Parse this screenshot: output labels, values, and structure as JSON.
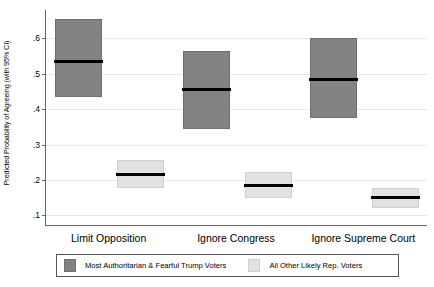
{
  "chart_data": {
    "type": "bar",
    "title": "",
    "xlabel": "",
    "ylabel": "Predicted Probability of Agreeing (with 95% CI)",
    "ylim": [
      0.07,
      0.68
    ],
    "yticks": [
      0.1,
      0.2,
      0.3,
      0.4,
      0.5,
      0.6
    ],
    "ytick_labels": [
      ".1",
      ".2",
      ".3",
      ".4",
      ".5",
      ".6"
    ],
    "grid": true,
    "legend_position": "bottom",
    "categories": [
      "Limit Opposition",
      "Ignore Congress",
      "Ignore Supreme Court"
    ],
    "series": [
      {
        "name": "Most Authoritarian & Fearful Trump Voters",
        "color": "#838383",
        "values": [
          0.535,
          0.455,
          0.485
        ],
        "ci_low": [
          0.433,
          0.345,
          0.375
        ],
        "ci_high": [
          0.655,
          0.565,
          0.6
        ]
      },
      {
        "name": "All Other Likely Rep. Voters",
        "color": "#e2e2e2",
        "values": [
          0.215,
          0.185,
          0.15
        ],
        "ci_low": [
          0.178,
          0.148,
          0.122
        ],
        "ci_high": [
          0.255,
          0.222,
          0.178
        ]
      }
    ]
  },
  "axis": {
    "y_title": "Predicted Probability of Agreeing (with 95% CI)",
    "y_tick_labels": [
      ".6",
      ".5",
      ".4",
      ".3",
      ".2",
      ".1"
    ]
  },
  "x_axis_labels": [
    "Limit Opposition",
    "Ignore Congress",
    "Ignore Supreme Court"
  ],
  "legend": {
    "entries": [
      {
        "label": "Most Authoritarian & Fearful Trump Voters",
        "color": "#838383"
      },
      {
        "label": "All Other Likely Rep. Voters",
        "color": "#e2e2e2"
      }
    ]
  },
  "colors": {
    "dark_group": "#838383",
    "light_group": "#e2e2e2",
    "median_line": "#000000",
    "axis": "#666666",
    "gridline": "#e8e8ea",
    "background": "#ffffff"
  }
}
